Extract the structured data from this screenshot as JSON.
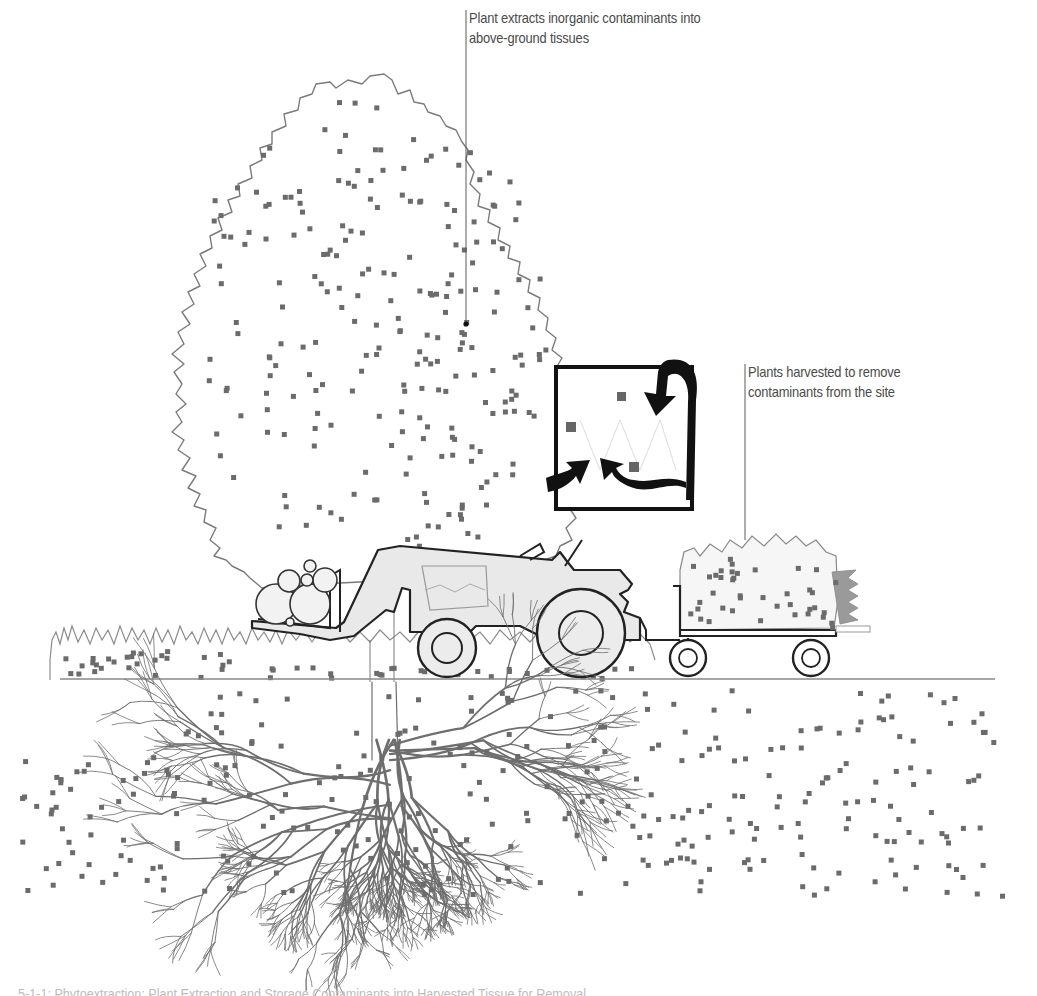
{
  "figure": {
    "type": "illustration",
    "subject": "phytoextraction",
    "annotations": [
      {
        "id": "extract",
        "lines": [
          "Plant extracts inorganic contaminants into",
          "above-ground tissues"
        ],
        "leader": {
          "x": 466,
          "top": 10,
          "bottom": 324,
          "end_dot": true
        }
      },
      {
        "id": "harvest",
        "lines": [
          "Plants harvested to remove",
          "contaminants from the site"
        ],
        "leader": {
          "x": 745,
          "top": 364,
          "bottom": 540,
          "end_dot": false
        }
      }
    ],
    "caption": "5-1-1: Phytoextraction: Plant Extraction and Storage Contaminants into Harvested Tissue for Removal"
  },
  "colors": {
    "background": "#ffffff",
    "outline": "#7a7a7a",
    "dark_outline": "#222222",
    "contaminant": "#6b6b6b",
    "tractor_fill": "#e8e8e8",
    "grass": "#8c8c8c",
    "text": "#4a4a4a",
    "leader": "#5a5a5a"
  },
  "elements": {
    "tree": {
      "label": "tree-canopy"
    },
    "inset_box": {
      "x": 554,
      "y": 367,
      "w": 138,
      "h": 142,
      "arrows": 3,
      "particles": 3
    },
    "tractor": {
      "label": "front-loader tractor carrying logs"
    },
    "trailer": {
      "label": "trailer with harvested plants"
    },
    "ground_line_y": 679,
    "roots": {
      "label": "root system"
    }
  }
}
